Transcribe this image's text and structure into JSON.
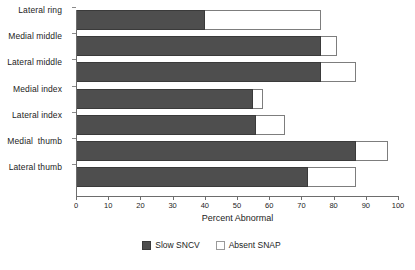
{
  "chart_data": {
    "type": "bar",
    "orientation": "horizontal",
    "stacked": true,
    "title": "",
    "xlabel": "Percent Abnormal",
    "ylabel": "",
    "xlim": [
      0,
      100
    ],
    "xticks": [
      0,
      10,
      20,
      30,
      40,
      50,
      60,
      70,
      80,
      90,
      100
    ],
    "xtick_labels": [
      "0",
      "10",
      "20",
      "30",
      "40",
      "50",
      "60",
      "70",
      "80",
      "90",
      "100"
    ],
    "grid": false,
    "legend_position": "bottom",
    "categories": [
      "Lateral ring",
      "Medial middle",
      "Lateral middle",
      "Medial index",
      "Lateral index",
      "Medial  thumb",
      "Lateral thumb"
    ],
    "series": [
      {
        "name": "Slow SNCV",
        "color": "#4e4e4e",
        "values": [
          40,
          76,
          76,
          55,
          56,
          87,
          72
        ]
      },
      {
        "name": "Absent SNAP",
        "color": "#ffffff",
        "cumulative_values": [
          76,
          81,
          87,
          58,
          65,
          97,
          87
        ],
        "values": [
          36,
          5,
          11,
          3,
          9,
          10,
          15
        ]
      }
    ]
  },
  "legend": {
    "items": [
      {
        "label": "Slow SNCV",
        "swatch": "dark"
      },
      {
        "label": "Absent SNAP",
        "swatch": "light"
      }
    ]
  },
  "colors": {
    "bar_dark": "#4e4e4e",
    "bar_light": "#ffffff",
    "axis": "#6d6d6d",
    "text": "#1c1c1c",
    "background": "#ffffff"
  }
}
